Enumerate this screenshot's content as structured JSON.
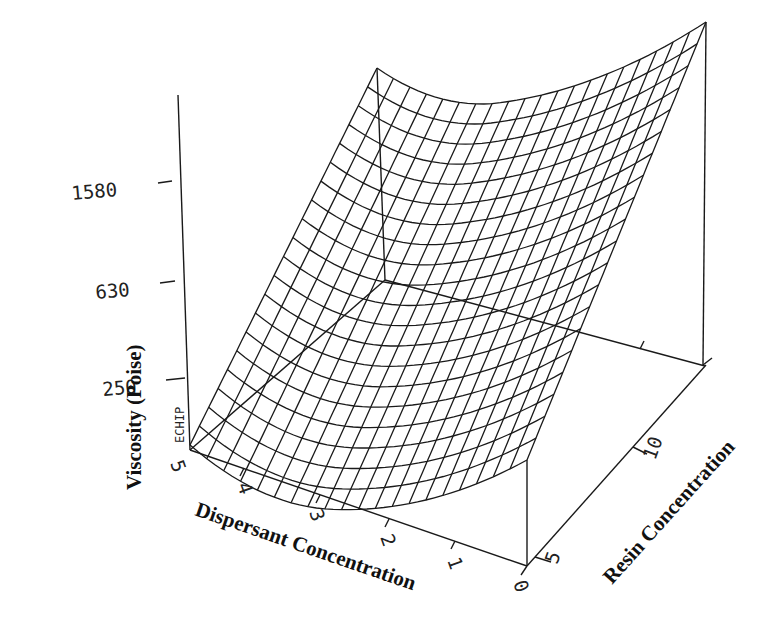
{
  "chart_data": {
    "type": "surface",
    "title": "",
    "zlabel": "Viscosity (Poise)",
    "xlabel": "Dispersant Concentration",
    "ylabel": "Resin Concentration",
    "z_ticks": [
      "250",
      "630",
      "1580"
    ],
    "x_ticks": [
      "5",
      "4",
      "3",
      "2",
      "1",
      "0"
    ],
    "y_ticks": [
      "5",
      "10"
    ],
    "watermark": "ECHIP",
    "grid": {
      "rows": 20,
      "cols": 20
    },
    "x_range": [
      0,
      5
    ],
    "y_range": [
      5,
      15
    ],
    "z_scale": "log"
  },
  "colors": {
    "line": "#1a1a1a",
    "background": "#ffffff"
  }
}
